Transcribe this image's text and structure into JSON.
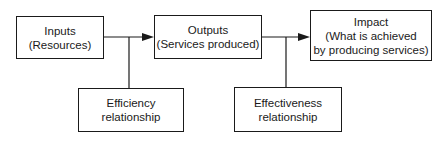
{
  "diagram": {
    "type": "flow",
    "nodes": [
      {
        "id": "inputs",
        "lines": [
          "Inputs",
          "(Resources)"
        ]
      },
      {
        "id": "outputs",
        "lines": [
          "Outputs",
          "(Services produced)"
        ]
      },
      {
        "id": "impact",
        "lines": [
          "Impact",
          "(What is achieved",
          "by producing services)"
        ]
      },
      {
        "id": "efficiency",
        "lines": [
          "Efficiency",
          "relationship"
        ]
      },
      {
        "id": "effectiveness",
        "lines": [
          "Effectiveness",
          "relationship"
        ]
      }
    ],
    "edges": [
      {
        "from": "inputs",
        "to": "outputs",
        "kind": "arrow"
      },
      {
        "from": "outputs",
        "to": "impact",
        "kind": "arrow"
      },
      {
        "from": "inputs-outputs-link",
        "to": "efficiency",
        "kind": "line"
      },
      {
        "from": "outputs-impact-link",
        "to": "effectiveness",
        "kind": "line"
      }
    ],
    "colors": {
      "stroke": "#1a1a1a",
      "background": "#ffffff"
    }
  }
}
